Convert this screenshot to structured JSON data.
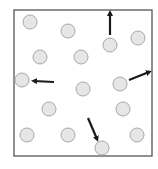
{
  "diagram": {
    "container": {
      "label": "container-box",
      "stroke": "#555555"
    },
    "particle_style": {
      "fill": "#e6e6e6",
      "stroke": "#a8a8a8"
    },
    "arrow_color": "#1a1a1a",
    "particles": [
      {
        "id": "p1"
      },
      {
        "id": "p2"
      },
      {
        "id": "p3",
        "velocity": "up"
      },
      {
        "id": "p4"
      },
      {
        "id": "p5"
      },
      {
        "id": "p6"
      },
      {
        "id": "p7",
        "velocity": "left"
      },
      {
        "id": "p8",
        "velocity": "up-right"
      },
      {
        "id": "p9"
      },
      {
        "id": "p10"
      },
      {
        "id": "p11"
      },
      {
        "id": "p12"
      },
      {
        "id": "p13"
      },
      {
        "id": "p14",
        "velocity": "down-right"
      },
      {
        "id": "p15"
      }
    ],
    "caption": ""
  }
}
